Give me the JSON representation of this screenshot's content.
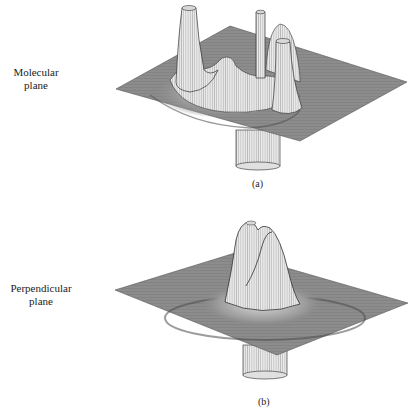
{
  "figure": {
    "panels": [
      {
        "id": "a",
        "side_label_line1": "Molecular",
        "side_label_line2": "plane",
        "caption": "(a)",
        "description": "3D wireframe surface plot of electron density in the molecular plane showing three tall peaks and a downward cylinder"
      },
      {
        "id": "b",
        "side_label_line1": "Perpendicular",
        "side_label_line2": "plane",
        "caption": "(b)",
        "description": "3D wireframe surface plot of electron density in the perpendicular plane showing a central double-lobed peak and a downward cylinder"
      }
    ],
    "colors": {
      "plane": "#8a8a8a",
      "plane_dark": "#5e5e5e",
      "peak": "#e6e6e6",
      "line": "#333333"
    }
  }
}
